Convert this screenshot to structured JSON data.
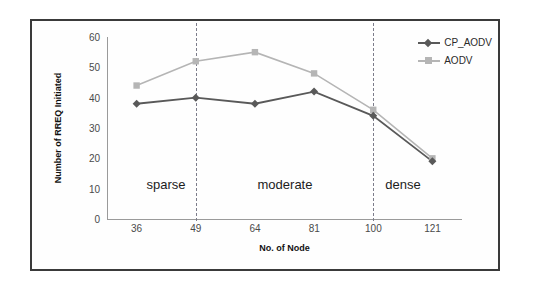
{
  "chart_data": {
    "type": "line",
    "title": "",
    "xlabel": "No. of Node",
    "ylabel": "Number of RREQ Initiated",
    "categories": [
      "36",
      "49",
      "64",
      "81",
      "100",
      "121"
    ],
    "ylim": [
      0,
      60
    ],
    "yticks": [
      "0",
      "10",
      "20",
      "30",
      "40",
      "50",
      "60"
    ],
    "grid": false,
    "legend_position": "top-right",
    "series": [
      {
        "name": "CP_AODV",
        "color": "#595959",
        "marker": "diamond",
        "values": [
          38,
          40,
          38,
          42,
          34,
          19
        ]
      },
      {
        "name": "AODV",
        "color": "#b5b5b5",
        "marker": "square",
        "values": [
          44,
          52,
          55,
          48,
          36,
          20
        ]
      }
    ],
    "annotations": [
      {
        "text": "sparse",
        "x_value": 0.5,
        "y_value": 8
      },
      {
        "text": "moderate",
        "x_value": 2.5,
        "y_value": 8
      },
      {
        "text": "dense",
        "x_value": 4.5,
        "y_value": 8
      }
    ],
    "dividers": [
      {
        "after_category": "49"
      },
      {
        "after_category": "100"
      }
    ]
  }
}
